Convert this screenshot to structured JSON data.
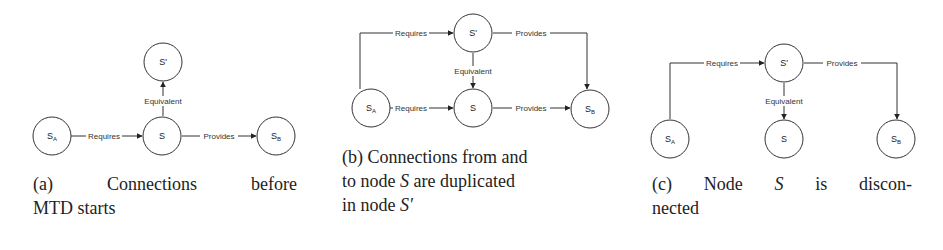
{
  "panels": [
    {
      "id": "a",
      "caption": {
        "line1": [
          "(a)",
          "Connections",
          "before"
        ],
        "line2": "MTD starts"
      },
      "nodes": {
        "sa": {
          "base": "S",
          "sub": "A"
        },
        "s": {
          "base": "S"
        },
        "sprime": {
          "base": "S'"
        },
        "sb": {
          "base": "S",
          "sub": "B"
        }
      },
      "edges": {
        "sa_s": "Requires",
        "s_sb": "Provides",
        "s_sprime": "Equivalent"
      }
    },
    {
      "id": "b",
      "caption": {
        "line1": "(b) Connections from and",
        "line2_pre": "to node ",
        "line2_var": "S",
        "line2_post": " are duplicated",
        "line3_pre": "in node ",
        "line3_var": "S′"
      },
      "nodes": {
        "sa": {
          "base": "S",
          "sub": "A"
        },
        "s": {
          "base": "S"
        },
        "sprime": {
          "base": "S'"
        },
        "sb": {
          "base": "S",
          "sub": "B"
        }
      },
      "edges": {
        "sa_sprime": "Requires",
        "sprime_sb": "Provides",
        "sprime_s": "Equivalent",
        "sa_s": "Requires",
        "s_sb": "Provides"
      }
    },
    {
      "id": "c",
      "caption": {
        "line1": [
          "(c)",
          "Node",
          "S",
          "is",
          "discon-"
        ],
        "line2": "nected"
      },
      "nodes": {
        "sa": {
          "base": "S",
          "sub": "A"
        },
        "s": {
          "base": "S"
        },
        "sprime": {
          "base": "S'"
        },
        "sb": {
          "base": "S",
          "sub": "B"
        }
      },
      "edges": {
        "sa_sprime": "Requires",
        "sprime_sb": "Provides",
        "sprime_s": "Equivalent"
      }
    }
  ]
}
